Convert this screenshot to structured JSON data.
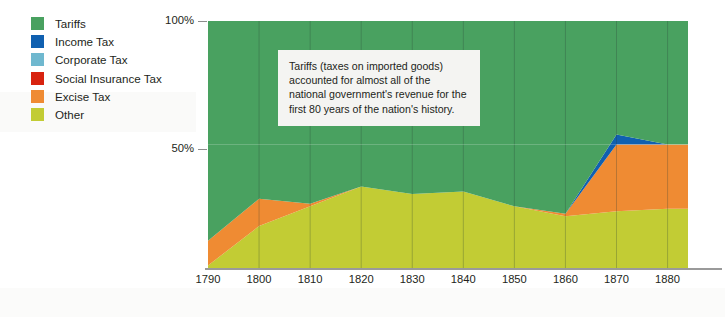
{
  "legend": {
    "items": [
      {
        "label": "Tariffs",
        "color": "#49a160",
        "icon": "legend-swatch-icon"
      },
      {
        "label": "Income Tax",
        "color": "#1060b0",
        "icon": "legend-swatch-icon"
      },
      {
        "label": "Corporate Tax",
        "color": "#6fb8cf",
        "icon": "legend-swatch-icon"
      },
      {
        "label": "Social Insurance Tax",
        "color": "#d8230f",
        "icon": "legend-swatch-icon"
      },
      {
        "label": "Excise Tax",
        "color": "#ef8b33",
        "icon": "legend-swatch-icon"
      },
      {
        "label": "Other",
        "color": "#c2cc34",
        "icon": "legend-swatch-icon"
      }
    ]
  },
  "annotation": {
    "text": "Tariffs (taxes on imported goods) accounted for almost all of the national government's revenue for the first 80 years of the nation's history."
  },
  "chart_data": {
    "type": "area",
    "title": "",
    "xlabel": "",
    "ylabel": "",
    "stacked": true,
    "normalized": true,
    "grid": true,
    "legend_position": "top-left",
    "xlim": [
      1790,
      1884
    ],
    "ylim": [
      0,
      100
    ],
    "yticks": [
      50,
      100
    ],
    "ytick_labels": [
      "50%",
      "100%"
    ],
    "x": [
      1790,
      1800,
      1810,
      1820,
      1830,
      1840,
      1850,
      1860,
      1870,
      1880,
      1884
    ],
    "xtick_labels": [
      "1790",
      "1800",
      "1810",
      "1820",
      "1830",
      "1840",
      "1850",
      "1860",
      "1870",
      "1880"
    ],
    "xticks": [
      1790,
      1800,
      1810,
      1820,
      1830,
      1840,
      1850,
      1860,
      1870,
      1880
    ],
    "series": [
      {
        "name": "Other",
        "color": "#c2cc34",
        "values": [
          1,
          17,
          25,
          33,
          30,
          31,
          25,
          21,
          23,
          24,
          24
        ]
      },
      {
        "name": "Excise Tax",
        "color": "#ef8b33",
        "values": [
          10,
          11,
          1,
          0,
          0,
          0,
          0,
          1,
          27,
          26,
          26
        ]
      },
      {
        "name": "Social Insurance Tax",
        "color": "#d8230f",
        "values": [
          0,
          0,
          0,
          0,
          0,
          0,
          0,
          0,
          0,
          0,
          0
        ]
      },
      {
        "name": "Corporate Tax",
        "color": "#6fb8cf",
        "values": [
          0,
          0,
          0,
          0,
          0,
          0,
          0,
          0,
          0,
          0,
          0
        ]
      },
      {
        "name": "Income Tax",
        "color": "#1060b0",
        "values": [
          0,
          0,
          0,
          0,
          0,
          0,
          0,
          0,
          4,
          0,
          0
        ]
      },
      {
        "name": "Tariffs",
        "color": "#49a160",
        "values": [
          89,
          72,
          74,
          67,
          70,
          69,
          75,
          78,
          46,
          50,
          50
        ]
      }
    ],
    "annotations": [
      {
        "name": "tariffs-callout",
        "text": "Tariffs (taxes on imported goods) accounted for almost all of the national government's revenue for the first 80 years of the nation's history."
      }
    ]
  }
}
